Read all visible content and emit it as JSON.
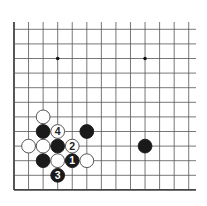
{
  "board": {
    "origin_x": 14,
    "origin_y": 29.3,
    "spacing_x": 14.56,
    "spacing_y": 14.6,
    "cols": 13,
    "rows": 12,
    "top_line_start_y": 22,
    "right_line_end_x": 196,
    "line_color": "#555555",
    "edge_color": "#444444",
    "star_points": [
      [
        3,
        2
      ],
      [
        9,
        2
      ]
    ]
  },
  "stones": [
    {
      "col": 2,
      "row": 6,
      "color": "white",
      "label": ""
    },
    {
      "col": 2,
      "row": 7,
      "color": "black",
      "label": ""
    },
    {
      "col": 3,
      "row": 7,
      "color": "white",
      "label": "4"
    },
    {
      "col": 5,
      "row": 7,
      "color": "black",
      "label": ""
    },
    {
      "col": 1,
      "row": 8,
      "color": "white",
      "label": ""
    },
    {
      "col": 2,
      "row": 8,
      "color": "white",
      "label": ""
    },
    {
      "col": 3,
      "row": 8,
      "color": "black",
      "label": ""
    },
    {
      "col": 4,
      "row": 8,
      "color": "white",
      "label": "2"
    },
    {
      "col": 9,
      "row": 8,
      "color": "black",
      "label": ""
    },
    {
      "col": 2,
      "row": 9,
      "color": "black",
      "label": ""
    },
    {
      "col": 3,
      "row": 9,
      "color": "white",
      "label": ""
    },
    {
      "col": 4,
      "row": 9,
      "color": "black",
      "label": "1"
    },
    {
      "col": 5,
      "row": 9,
      "color": "white",
      "label": ""
    },
    {
      "col": 3,
      "row": 10,
      "color": "black",
      "label": "3"
    }
  ]
}
